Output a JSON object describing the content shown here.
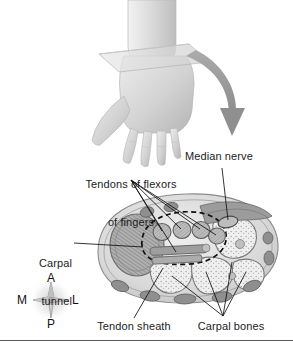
{
  "figure": {
    "background_color": "#ffffff",
    "width": 293,
    "height": 343,
    "has_bottom_rule": true
  },
  "labels": {
    "tendons_of_flexors": {
      "line1": "Tendons of flexors",
      "line2": "of fingers",
      "leader_count": 5
    },
    "median_nerve": {
      "text": "Median nerve",
      "leader_count": 1
    },
    "carpal_tunnel": {
      "line1": "Carpal",
      "line2": "tunnel",
      "leader_count": 1
    },
    "tendon_sheath": {
      "text": "Tendon sheath",
      "leader_count": 1
    },
    "carpal_bones": {
      "text": "Carpal bones",
      "leader_count": 4
    }
  },
  "compass": {
    "name": "anatomical-orientation-compass",
    "anterior": "A",
    "posterior": "P",
    "medial": "M",
    "lateral": "L"
  },
  "illustration": {
    "hand": {
      "name": "hand-palm-down",
      "description": "Right hand shown palm down with forearm, intersected by a translucent sectioning plane at the wrist"
    },
    "section_plane": {
      "name": "cutting-plane",
      "description": "Translucent parallelogram slicing through the wrist"
    },
    "arrow": {
      "name": "curved-arrow",
      "description": "Curved gray arrow leading from the wrist section down to the cross-section view"
    },
    "cross_section": {
      "name": "wrist-cross-section",
      "description": "Transverse section of the wrist at the level of the carpal tunnel"
    }
  },
  "colors": {
    "ink": "#1c1c1c",
    "leader_line": "#111111",
    "arrow_fill": "#9a9a9a",
    "skin_light": "#dcdcdc",
    "skin_mid": "#c4c4c4",
    "tissue_light": "#e6e6e6",
    "tissue_mid": "#c9c9c9",
    "tissue_dark": "#8f8f8f",
    "bone_fill": "#efefef",
    "muscle_fill": "#a8a8a8",
    "rule": "#5a5a5a"
  }
}
